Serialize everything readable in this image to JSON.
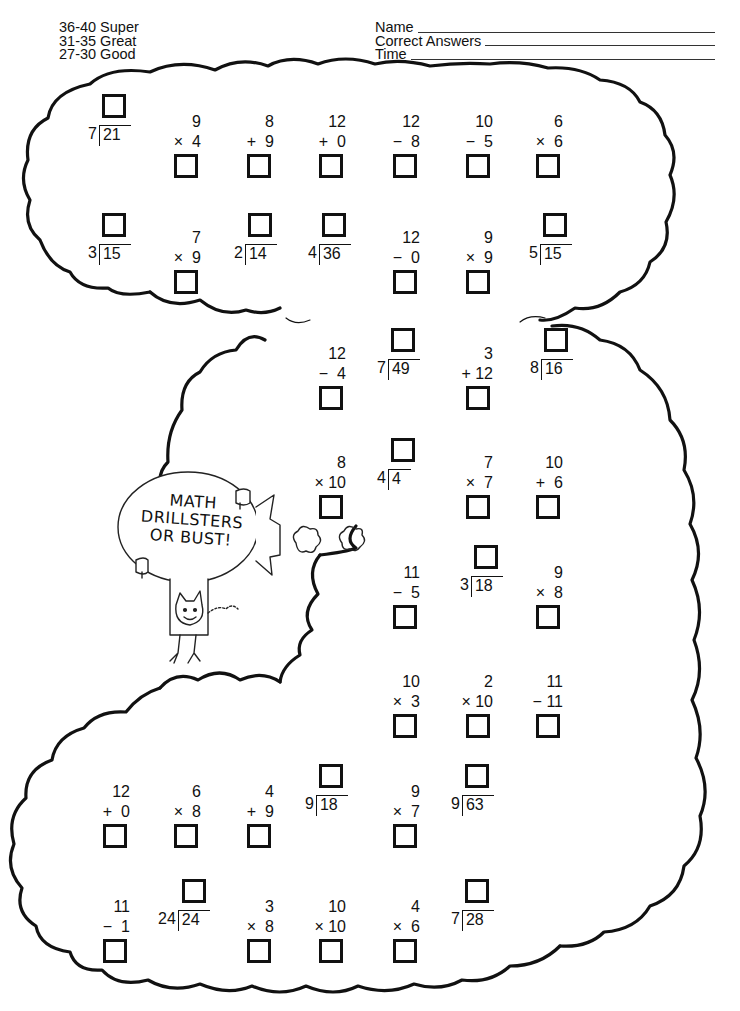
{
  "header": {
    "scoring": [
      {
        "range": "36-40",
        "label": "Super",
        "text": "36-40 Super"
      },
      {
        "range": "31-35",
        "label": "Great",
        "text": "31-35 Great"
      },
      {
        "range": "27-30",
        "label": "Good",
        "text": "27-30 Good"
      }
    ],
    "fields": [
      {
        "label": "Name",
        "value": ""
      },
      {
        "label": "Correct Answers",
        "value": ""
      },
      {
        "label": "Time",
        "value": ""
      }
    ]
  },
  "illustration": {
    "balloon_text": [
      "MATH",
      "DRILLSTERS",
      "OR BUST!"
    ],
    "description": "cat riding a blimp-shaped balloon"
  },
  "problems": [
    {
      "id": 1,
      "type": "division",
      "divisor": "7",
      "dividend": "21",
      "x": 88,
      "y": 94
    },
    {
      "id": 2,
      "type": "vertical",
      "top": "9",
      "op": "×",
      "bottom": "4",
      "x": 155,
      "y": 112
    },
    {
      "id": 3,
      "type": "vertical",
      "top": "8",
      "op": "+",
      "bottom": "9",
      "x": 228,
      "y": 112
    },
    {
      "id": 4,
      "type": "vertical",
      "top": "12",
      "op": "+",
      "bottom": "0",
      "x": 300,
      "y": 112
    },
    {
      "id": 5,
      "type": "vertical",
      "top": "12",
      "op": "−",
      "bottom": "8",
      "x": 374,
      "y": 112
    },
    {
      "id": 6,
      "type": "vertical",
      "top": "10",
      "op": "−",
      "bottom": "5",
      "x": 447,
      "y": 112
    },
    {
      "id": 7,
      "type": "vertical",
      "top": "6",
      "op": "×",
      "bottom": "6",
      "x": 517,
      "y": 112
    },
    {
      "id": 8,
      "type": "division",
      "divisor": "3",
      "dividend": "15",
      "x": 88,
      "y": 213
    },
    {
      "id": 9,
      "type": "vertical",
      "top": "7",
      "op": "×",
      "bottom": "9",
      "x": 155,
      "y": 228
    },
    {
      "id": 10,
      "type": "division",
      "divisor": "2",
      "dividend": "14",
      "x": 234,
      "y": 213
    },
    {
      "id": 11,
      "type": "division",
      "divisor": "4",
      "dividend": "36",
      "x": 308,
      "y": 213
    },
    {
      "id": 12,
      "type": "vertical",
      "top": "12",
      "op": "−",
      "bottom": "0",
      "x": 374,
      "y": 228
    },
    {
      "id": 13,
      "type": "vertical",
      "top": "9",
      "op": "×",
      "bottom": "9",
      "x": 447,
      "y": 228
    },
    {
      "id": 14,
      "type": "division",
      "divisor": "5",
      "dividend": "15",
      "x": 529,
      "y": 213
    },
    {
      "id": 15,
      "type": "vertical",
      "top": "12",
      "op": "−",
      "bottom": "4",
      "x": 300,
      "y": 344
    },
    {
      "id": 16,
      "type": "division",
      "divisor": "7",
      "dividend": "49",
      "x": 377,
      "y": 328
    },
    {
      "id": 17,
      "type": "vertical",
      "top": "3",
      "op": "+",
      "bottom": "12",
      "x": 447,
      "y": 344
    },
    {
      "id": 18,
      "type": "division",
      "divisor": "8",
      "dividend": "16",
      "x": 530,
      "y": 328
    },
    {
      "id": 19,
      "type": "vertical",
      "top": "8",
      "op": "×",
      "bottom": "10",
      "x": 300,
      "y": 453
    },
    {
      "id": 20,
      "type": "division",
      "divisor": "4",
      "dividend": "4",
      "x": 377,
      "y": 438
    },
    {
      "id": 21,
      "type": "vertical",
      "top": "7",
      "op": "×",
      "bottom": "7",
      "x": 447,
      "y": 453
    },
    {
      "id": 22,
      "type": "vertical",
      "top": "10",
      "op": "+",
      "bottom": "6",
      "x": 517,
      "y": 453
    },
    {
      "id": 23,
      "type": "vertical",
      "top": "11",
      "op": "−",
      "bottom": "5",
      "x": 374,
      "y": 563
    },
    {
      "id": 24,
      "type": "division",
      "divisor": "3",
      "dividend": "18",
      "x": 460,
      "y": 545
    },
    {
      "id": 25,
      "type": "vertical",
      "top": "9",
      "op": "×",
      "bottom": "8",
      "x": 517,
      "y": 563
    },
    {
      "id": 26,
      "type": "vertical",
      "top": "10",
      "op": "×",
      "bottom": "3",
      "x": 374,
      "y": 672
    },
    {
      "id": 27,
      "type": "vertical",
      "top": "2",
      "op": "×",
      "bottom": "10",
      "x": 447,
      "y": 672
    },
    {
      "id": 28,
      "type": "vertical",
      "top": "11",
      "op": "−",
      "bottom": "11",
      "x": 517,
      "y": 672
    },
    {
      "id": 29,
      "type": "vertical",
      "top": "12",
      "op": "+",
      "bottom": "0",
      "x": 84,
      "y": 782
    },
    {
      "id": 30,
      "type": "vertical",
      "top": "6",
      "op": "×",
      "bottom": "8",
      "x": 155,
      "y": 782
    },
    {
      "id": 31,
      "type": "vertical",
      "top": "4",
      "op": "+",
      "bottom": "9",
      "x": 228,
      "y": 782
    },
    {
      "id": 32,
      "type": "division",
      "divisor": "9",
      "dividend": "18",
      "x": 305,
      "y": 764
    },
    {
      "id": 33,
      "type": "vertical",
      "top": "9",
      "op": "×",
      "bottom": "7",
      "x": 374,
      "y": 782
    },
    {
      "id": 34,
      "type": "division",
      "divisor": "9",
      "dividend": "63",
      "x": 451,
      "y": 764
    },
    {
      "id": 35,
      "type": "vertical",
      "top": "11",
      "op": "−",
      "bottom": "1",
      "x": 84,
      "y": 897
    },
    {
      "id": 36,
      "type": "division",
      "divisor": "24",
      "dividend": "24",
      "x": 158,
      "y": 879
    },
    {
      "id": 37,
      "type": "vertical",
      "top": "3",
      "op": "×",
      "bottom": "8",
      "x": 228,
      "y": 897
    },
    {
      "id": 38,
      "type": "vertical",
      "top": "10",
      "op": "×",
      "bottom": "10",
      "x": 300,
      "y": 897
    },
    {
      "id": 39,
      "type": "vertical",
      "top": "4",
      "op": "×",
      "bottom": "6",
      "x": 374,
      "y": 897
    },
    {
      "id": 40,
      "type": "division",
      "divisor": "7",
      "dividend": "28",
      "x": 451,
      "y": 879
    }
  ]
}
